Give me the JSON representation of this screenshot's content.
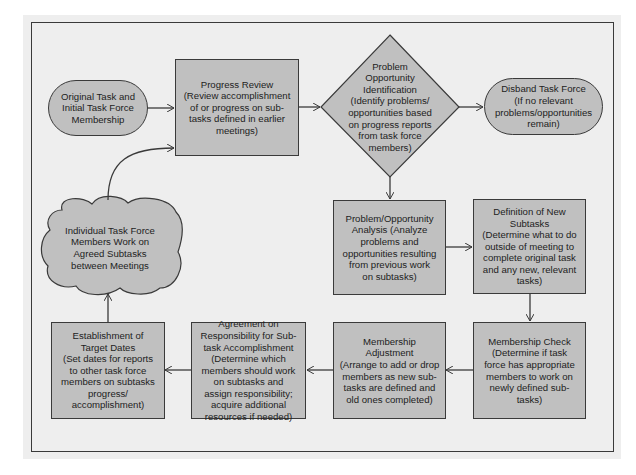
{
  "diagram": {
    "type": "flowchart",
    "nodes": {
      "original_task": {
        "shape": "oval",
        "text": "Original Task and\nInitial Task Force\nMembership"
      },
      "progress_review": {
        "shape": "rectangle",
        "text": "Progress Review\n(Review accomplishment\nof or progress on sub-\ntasks defined in earlier\nmeetings)"
      },
      "problem_identification": {
        "shape": "diamond",
        "text": "Problem\nOpportunity\nIdentification\n(Identify problems/\nopportunities based\non progress reports\nfrom task force\nmembers)"
      },
      "disband": {
        "shape": "oval",
        "text": "Disband Task Force\n(If no relevant\nproblems/opportunities\nremain)"
      },
      "individual_work": {
        "shape": "cloud",
        "text": "Individual Task Force\nMembers Work on\nAgreed Subtasks\nbetween Meetings"
      },
      "problem_analysis": {
        "shape": "rectangle",
        "text": "Problem/Opportunity\nAnalysis (Analyze\nproblems and\nopportunities resulting\nfrom previous work\non subtasks)"
      },
      "definition_subtasks": {
        "shape": "rectangle",
        "text": "Definition of New\nSubtasks\n(Determine what to do\noutside of meeting to\ncomplete original task\nand any new, relevant\ntasks)"
      },
      "target_dates": {
        "shape": "rectangle",
        "text": "Establishment of\nTarget Dates\n(Set dates for reports\nto other task force\nmembers on subtasks\nprogress/\naccomplishment)"
      },
      "agreement": {
        "shape": "rectangle",
        "text": "Agreement on\nResponsibility for Sub-\ntask Accomplishment\n(Determine which\nmembers should work\non subtasks and\nassign responsibility;\nacquire additional\nresources if needed)"
      },
      "membership_adjustment": {
        "shape": "rectangle",
        "text": "Membership\nAdjustment\n(Arrange to add or drop\nmembers as new sub-\ntasks are defined and\nold ones completed)"
      },
      "membership_check": {
        "shape": "rectangle",
        "text": "Membership Check\n(Determine if task\nforce has appropriate\nmembers to work on\nnewly defined sub-\ntasks)"
      }
    },
    "edges": [
      [
        "original_task",
        "progress_review"
      ],
      [
        "progress_review",
        "problem_identification"
      ],
      [
        "problem_identification",
        "disband"
      ],
      [
        "problem_identification",
        "problem_analysis"
      ],
      [
        "problem_analysis",
        "definition_subtasks"
      ],
      [
        "definition_subtasks",
        "membership_check"
      ],
      [
        "membership_check",
        "membership_adjustment"
      ],
      [
        "membership_adjustment",
        "agreement"
      ],
      [
        "agreement",
        "target_dates"
      ],
      [
        "target_dates",
        "individual_work"
      ],
      [
        "individual_work",
        "progress_review"
      ]
    ],
    "colors": {
      "node_fill": "#c0c0c0",
      "panel": "#eeeeee",
      "stroke": "#3a3a3a"
    }
  }
}
